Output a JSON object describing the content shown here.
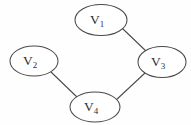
{
  "figure": {
    "background_color": "#fefefe",
    "stroke_color": "#4a4a4a",
    "label_color": "#2e2e2e",
    "node_fill_color": "#ffffff"
  },
  "graph_data": {
    "type": "node-link-diagram",
    "directed": false,
    "node_shape": "ellipse",
    "node_count": 4,
    "edge_count": 3,
    "nodes": [
      {
        "id": "V1",
        "label_base": "V",
        "label_sub": "1",
        "label": "V1",
        "cx": 101,
        "cy": 20,
        "rx": 26,
        "ry": 15.5
      },
      {
        "id": "V2",
        "label_base": "V",
        "label_sub": "2",
        "label": "V2",
        "cx": 34,
        "cy": 61,
        "rx": 24,
        "ry": 15
      },
      {
        "id": "V3",
        "label_base": "V",
        "label_sub": "3",
        "label": "V3",
        "cx": 162,
        "cy": 62,
        "rx": 24,
        "ry": 15.5
      },
      {
        "id": "V4",
        "label_base": "V",
        "label_sub": "4",
        "label": "V4",
        "cx": 95,
        "cy": 107,
        "rx": 25,
        "ry": 15
      }
    ],
    "edges": [
      {
        "id": "edge-v1-v3",
        "source": "V1",
        "target": "V3",
        "x1": 123,
        "y1": 29,
        "x2": 147,
        "y2": 52
      },
      {
        "id": "edge-v2-v4",
        "source": "V2",
        "target": "V4",
        "x1": 51,
        "y1": 72,
        "x2": 78,
        "y2": 98
      },
      {
        "id": "edge-v3-v4",
        "source": "V3",
        "target": "V4",
        "x1": 145,
        "y1": 73,
        "x2": 115,
        "y2": 101
      }
    ]
  }
}
